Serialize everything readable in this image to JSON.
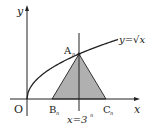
{
  "diagram": {
    "labels": {
      "y_axis": "y",
      "x_axis": "x",
      "origin": "O",
      "point_a": "A",
      "point_a_sub": "n",
      "point_b": "B",
      "point_b_sub": "n",
      "point_c": "C",
      "point_c_sub": "n",
      "curve": "y=√x",
      "vertical_line": "x=3",
      "vertical_line_sup": "n"
    },
    "colors": {
      "ink": "#222222",
      "triangle_fill": "#b0b0b0"
    }
  }
}
